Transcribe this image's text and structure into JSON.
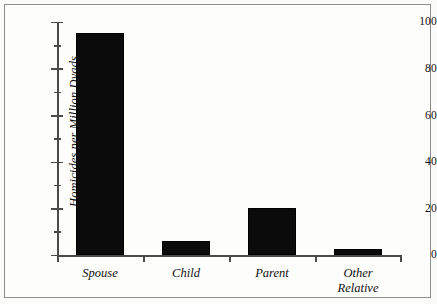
{
  "chart_data": {
    "type": "bar",
    "title": "",
    "subtitle": "",
    "xlabel": "",
    "ylabel": "Homicides per Million Dyads",
    "categories": [
      "Spouse",
      "Child",
      "Parent",
      "Other Relative"
    ],
    "values": [
      95,
      6,
      20,
      2.5
    ],
    "series": [
      {
        "name": "Homicides per Million Dyads",
        "values": [
          95,
          6,
          20,
          2.5
        ]
      }
    ],
    "ylim": [
      0,
      100
    ],
    "y_major_ticks": [
      0,
      20,
      40,
      60,
      80,
      100
    ],
    "y_minor_ticks": [
      10,
      30,
      50,
      70,
      90
    ],
    "y_tick_labels": [
      "0",
      "20",
      "40",
      "60",
      "80",
      "100"
    ],
    "grid": false,
    "legend": false,
    "legend_position": "none",
    "bar_color": "#0b0b0b",
    "axis_color": "#4a4a4a",
    "background_color": "#fdfdfb",
    "frame_color": "#8e8e8e",
    "annotations": []
  },
  "axis": {
    "y_title": "Homicides per Million Dyads",
    "labels": {
      "t0": "0",
      "t20": "20",
      "t40": "40",
      "t60": "60",
      "t80": "80",
      "t100": "100"
    }
  },
  "categories": {
    "spouse": {
      "label": "Spouse",
      "line1": "Spouse",
      "line2": ""
    },
    "child": {
      "label": "Child",
      "line1": "Child",
      "line2": ""
    },
    "parent": {
      "label": "Parent",
      "line1": "Parent",
      "line2": ""
    },
    "other_relative": {
      "label": "Other Relative",
      "line1": "Other",
      "line2": "Relative"
    }
  }
}
